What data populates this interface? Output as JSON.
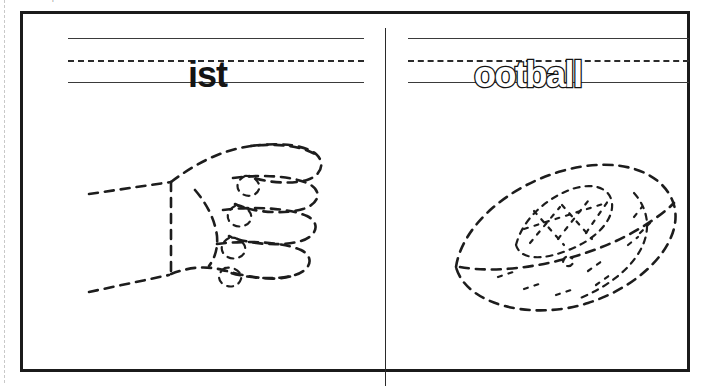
{
  "instruction": "Finish the picture. Match the word.",
  "panels": [
    {
      "name": "fist-panel",
      "word": "ist",
      "word_style": "solid",
      "picture": "fist-drawing",
      "picture_label": "fist"
    },
    {
      "name": "football-panel",
      "word": "ootball",
      "word_style": "outline",
      "picture": "football-drawing",
      "picture_label": "football"
    }
  ],
  "rules": {
    "top_line": "solid",
    "middle_line": "dashed",
    "bottom_line": "solid"
  },
  "colors": {
    "ink": "#1b1b1b",
    "rule": "#3a3a3a",
    "paper": "#ffffff",
    "instruction_text": "#9a9a9a"
  }
}
